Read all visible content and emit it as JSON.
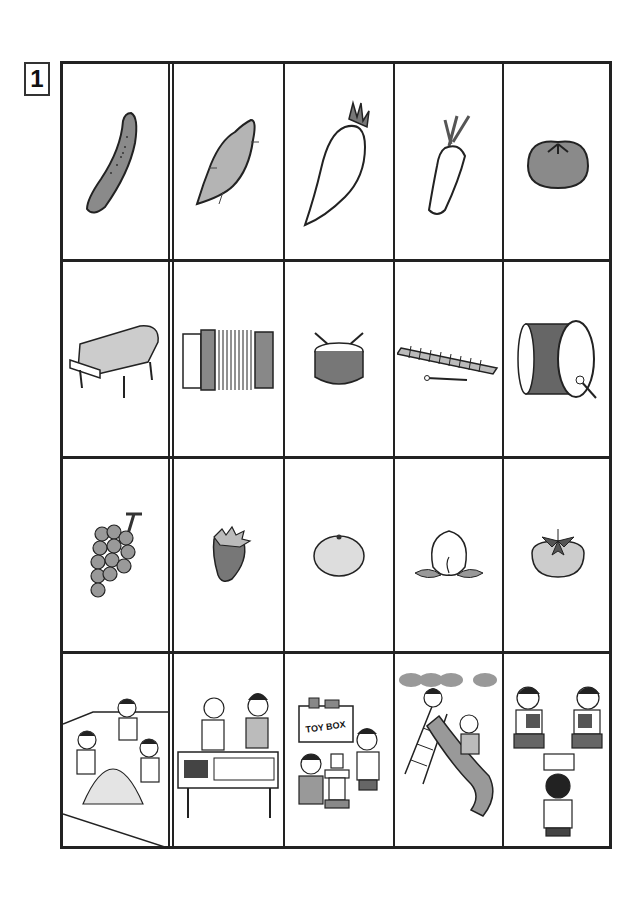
{
  "worksheet": {
    "number": "1",
    "rows": [
      {
        "category": "vegetables",
        "items": [
          {
            "name": "cucumber"
          },
          {
            "name": "sweet potato"
          },
          {
            "name": "daikon radish"
          },
          {
            "name": "carrot"
          },
          {
            "name": "tomato"
          }
        ]
      },
      {
        "category": "musical instruments",
        "items": [
          {
            "name": "grand piano"
          },
          {
            "name": "accordion"
          },
          {
            "name": "snare drum"
          },
          {
            "name": "xylophone"
          },
          {
            "name": "bass drum"
          }
        ]
      },
      {
        "category": "fruits",
        "items": [
          {
            "name": "grapes"
          },
          {
            "name": "strawberry"
          },
          {
            "name": "mandarin orange"
          },
          {
            "name": "peach"
          },
          {
            "name": "persimmon"
          }
        ]
      },
      {
        "category": "play scenes",
        "items": [
          {
            "name": "children playing in sandbox"
          },
          {
            "name": "children drawing at table"
          },
          {
            "name": "children building with toy blocks",
            "sign_text": "TOY BOX"
          },
          {
            "name": "children on slide"
          },
          {
            "name": "children playing cards"
          }
        ]
      }
    ]
  },
  "colors": {
    "line": "#222222",
    "fill_gray": "#9a9a9a",
    "fill_dark": "#6e6e6e",
    "fill_light": "#d0d0d0"
  }
}
